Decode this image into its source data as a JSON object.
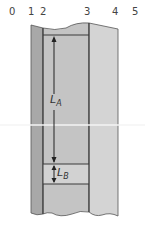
{
  "figure": {
    "type": "cross-section diagram",
    "column_labels": [
      {
        "text": "0",
        "x": 12
      },
      {
        "text": "1",
        "x": 31
      },
      {
        "text": "2",
        "x": 43
      },
      {
        "text": "3",
        "x": 87
      },
      {
        "text": "4",
        "x": 115
      },
      {
        "text": "5",
        "x": 135
      }
    ],
    "dimensions": {
      "la": {
        "main": "L",
        "sub": "A"
      },
      "lb": {
        "main": "L",
        "sub": "B"
      }
    },
    "colors": {
      "left_strip": "#a8a8a8",
      "middle_panel": "#c4c4c4",
      "lb_band": "#d2d2d2",
      "right_panel": "#d4d4d4",
      "outline": "#3a3a3a",
      "white_line": "#f4f4f4"
    }
  }
}
